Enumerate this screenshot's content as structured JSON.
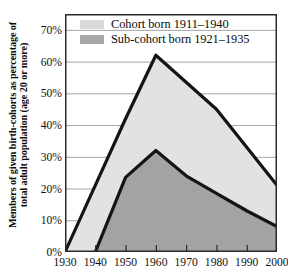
{
  "chart_data": {
    "type": "area",
    "title": "",
    "xlabel": "",
    "ylabel_line1": "Members of given birth-cohorts as percentage of",
    "ylabel_line2": "total adult population (age 20 or more)",
    "x": [
      1930,
      1940,
      1950,
      1960,
      1970,
      1980,
      1990,
      2000
    ],
    "xlim": [
      1930,
      2000
    ],
    "ylim": [
      0,
      75
    ],
    "yticks": [
      0,
      10,
      20,
      30,
      40,
      50,
      60,
      70
    ],
    "ytick_labels": [
      "0%",
      "10%",
      "20%",
      "30%",
      "40%",
      "50%",
      "60%",
      "70%"
    ],
    "xtick_labels": [
      "1930",
      "1940",
      "1950",
      "1960",
      "1970",
      "1980",
      "1990",
      "2000"
    ],
    "grid": true,
    "grid_axis": "y",
    "legend_position": "top-left-inside",
    "series": [
      {
        "name": "Cohort born 1911–1940",
        "color": "#e2e2e2",
        "line_color": "#141414",
        "x": [
          1930,
          1940,
          1950,
          1960,
          1970,
          1980,
          1990,
          2000
        ],
        "values": [
          0,
          21,
          42,
          62,
          53.5,
          45,
          33,
          21
        ]
      },
      {
        "name": "Sub-cohort born 1921–1935",
        "color": "#a3a3a3",
        "line_color": "#141414",
        "x": [
          1940,
          1950,
          1960,
          1970,
          1980,
          1990,
          2000
        ],
        "values": [
          0,
          23.5,
          32,
          24,
          18.5,
          13,
          8
        ]
      }
    ]
  },
  "legend": {
    "items": [
      {
        "label": "Cohort born 1911–1940",
        "color": "#dadada"
      },
      {
        "label": "Sub-cohort born 1921–1935",
        "color": "#a8a8a8"
      }
    ]
  },
  "axes": {
    "y_title_line1": "Members of given birth-cohorts as percentage of",
    "y_title_line2": "total adult population (age 20 or more)",
    "y_labels": [
      "70%",
      "60%",
      "50%",
      "40%",
      "30%",
      "20%",
      "10%",
      "0%"
    ],
    "x_labels": [
      "1930",
      "1940",
      "1950",
      "1960",
      "1970",
      "1980",
      "1990",
      "2000"
    ]
  },
  "colors": {
    "cohort_fill": "#e2e2e2",
    "subcohort_fill": "#a3a3a3",
    "line": "#141414",
    "grid": "#9a9a9a",
    "frame": "#2a2a2a",
    "text": "#111111"
  }
}
